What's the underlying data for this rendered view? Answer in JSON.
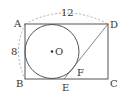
{
  "figure": {
    "type": "geometry",
    "shape": "rectangle ABCD with inscribed circle O and segment DF",
    "points": {
      "A": {
        "label": "A",
        "x": 25,
        "y": 24
      },
      "B": {
        "label": "B",
        "x": 25,
        "y": 79
      },
      "C": {
        "label": "C",
        "x": 108,
        "y": 79
      },
      "D": {
        "label": "D",
        "x": 108,
        "y": 24
      },
      "O": {
        "label": "O",
        "x": 52,
        "y": 51
      },
      "E": {
        "label": "E",
        "x": 64,
        "y": 79
      },
      "F": {
        "label": "F",
        "x": 77,
        "y": 68
      }
    },
    "dimensions": {
      "AD": "12",
      "AB": "8"
    },
    "colors": {
      "line": "#555555",
      "dashed": "#999999",
      "text": "#333333"
    }
  }
}
